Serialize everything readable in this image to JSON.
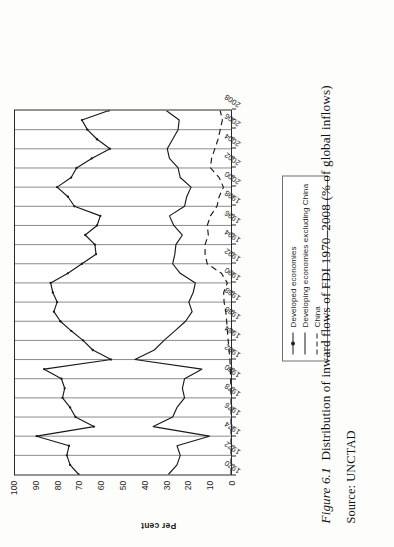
{
  "figure": {
    "number": "Figure 6.1",
    "title": "Distribution of inward flows of FDI 1970–2008 (% of global inflows)",
    "source": "Source: UNCTAD"
  },
  "legend": {
    "position": "top-right-outside",
    "items": [
      {
        "label": "Developed economies",
        "style": "solid-marker",
        "marker": "filled-diamond"
      },
      {
        "label": "Developing economies excluding China",
        "style": "solid",
        "marker": "none"
      },
      {
        "label": "China",
        "style": "dashed",
        "marker": "none"
      }
    ]
  },
  "chart_data": {
    "type": "line",
    "title": "Distribution of inward flows of FDI 1970–2008 (% of global inflows)",
    "xlabel": "",
    "ylabel": "Per cent",
    "ylim": [
      0,
      100
    ],
    "yticks": [
      0,
      10,
      20,
      30,
      40,
      50,
      60,
      70,
      80,
      90,
      100
    ],
    "ytick_labels": [
      "0",
      "10",
      "20",
      "30",
      "40",
      "50",
      "60",
      "70",
      "80",
      "90",
      "100"
    ],
    "grid": "vertical-only",
    "xlim": [
      1970,
      2008
    ],
    "xticks": [
      1970,
      1972,
      1974,
      1976,
      1978,
      1980,
      1982,
      1984,
      1986,
      1988,
      1990,
      1992,
      1994,
      1996,
      1998,
      2000,
      2002,
      2004,
      2006,
      2008
    ],
    "xtick_labels": [
      "1970",
      "1972",
      "1974",
      "1976",
      "1978",
      "1980",
      "1982",
      "1984",
      "1986",
      "1988",
      "1990",
      "1992",
      "1994",
      "1996",
      "1998",
      "2000",
      "2002",
      "2004",
      "2006",
      "2008"
    ],
    "x": [
      1970,
      1971,
      1972,
      1973,
      1974,
      1975,
      1976,
      1977,
      1978,
      1979,
      1980,
      1981,
      1982,
      1983,
      1984,
      1985,
      1986,
      1987,
      1988,
      1989,
      1990,
      1991,
      1992,
      1993,
      1994,
      1995,
      1996,
      1997,
      1998,
      1999,
      2000,
      2001,
      2002,
      2003,
      2004,
      2005,
      2006,
      2007,
      2008
    ],
    "series": [
      {
        "name": "Developed economies",
        "style": "solid-marker",
        "values": [
          70.5,
          74.5,
          76.0,
          75.0,
          90.0,
          63.5,
          72.0,
          74.5,
          78.0,
          77.0,
          78.5,
          86.5,
          55.5,
          64.0,
          68.5,
          74.0,
          79.0,
          82.0,
          80.5,
          82.5,
          83.5,
          75.5,
          69.0,
          62.5,
          63.0,
          67.5,
          62.0,
          60.5,
          72.5,
          75.5,
          80.5,
          74.0,
          71.5,
          64.5,
          56.0,
          62.0,
          66.5,
          69.0,
          56.5
        ]
      },
      {
        "name": "Developing economies excluding China",
        "style": "solid",
        "values": [
          29.0,
          25.0,
          23.5,
          25.0,
          10.0,
          36.0,
          27.0,
          25.0,
          21.5,
          22.5,
          21.5,
          13.5,
          44.5,
          35.5,
          31.0,
          26.0,
          21.0,
          18.0,
          19.5,
          17.5,
          16.5,
          23.5,
          27.0,
          26.0,
          25.5,
          22.5,
          26.5,
          28.5,
          21.5,
          20.5,
          18.5,
          23.5,
          24.5,
          28.5,
          29.5,
          27.0,
          24.5,
          24.0,
          30.0
        ]
      },
      {
        "name": "China",
        "style": "dashed",
        "values": [
          0.0,
          0.0,
          0.0,
          0.0,
          0.0,
          0.0,
          0.0,
          0.0,
          0.0,
          0.1,
          0.2,
          0.3,
          0.5,
          0.9,
          1.3,
          1.7,
          2.0,
          2.4,
          3.2,
          3.4,
          1.7,
          4.4,
          11.0,
          12.0,
          12.0,
          10.5,
          11.0,
          9.5,
          6.5,
          5.5,
          3.5,
          5.5,
          9.5,
          9.0,
          7.5,
          6.0,
          5.0,
          4.0,
          5.0
        ]
      }
    ],
    "annotations": []
  }
}
